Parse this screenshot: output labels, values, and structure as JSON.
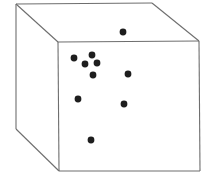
{
  "diagram": {
    "type": "3d-cube-scatter",
    "colors": {
      "edge": "#6e6e6e",
      "point": "#1e1e1e",
      "background": "#ffffff"
    },
    "cube": {
      "back": {
        "tl": [
          16,
          4
        ],
        "tr": [
          152,
          3
        ],
        "bl": [
          16,
          129
        ]
      },
      "front": {
        "tl": [
          58,
          42
        ],
        "tr": [
          199,
          41
        ],
        "bl": [
          59,
          171
        ],
        "br": [
          200,
          171
        ]
      }
    },
    "points": [
      [
        123,
        32
      ],
      [
        74,
        58
      ],
      [
        92,
        55
      ],
      [
        85,
        64
      ],
      [
        97,
        63
      ],
      [
        93,
        75
      ],
      [
        128,
        74
      ],
      [
        78,
        99
      ],
      [
        124,
        104
      ],
      [
        91,
        140
      ]
    ],
    "point_radius": 3.4
  }
}
